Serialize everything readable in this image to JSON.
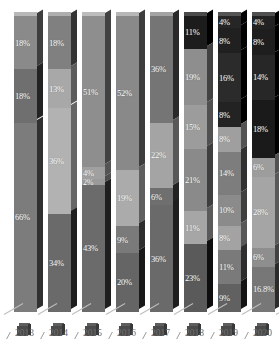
{
  "chart_data": {
    "type": "bar",
    "subtype": "stacked-percentage-3d",
    "title": "",
    "xlabel": "",
    "ylabel": "",
    "ylim": [
      0,
      100
    ],
    "grid": false,
    "legend": "none",
    "categories": [
      "2013",
      "2014",
      "2015",
      "2016",
      "2017",
      "2018",
      "2019",
      "2020"
    ],
    "label_suffix": "%",
    "bars": [
      {
        "category": "2013",
        "segments": [
          {
            "label": "18%",
            "value": 18,
            "color": "#8a8a8a"
          },
          {
            "label": "18%",
            "value": 18,
            "color": "#6f6f6f"
          },
          {
            "label": "66%",
            "value": 64,
            "color": "#7c7c7c"
          }
        ]
      },
      {
        "category": "2014",
        "segments": [
          {
            "label": "18%",
            "value": 18,
            "color": "#808080"
          },
          {
            "label": "13%",
            "value": 13,
            "color": "#a8a8a8"
          },
          {
            "label": "36%",
            "value": 36,
            "color": "#b2b2b2"
          },
          {
            "label": "34%",
            "value": 33,
            "color": "#6a6a6a"
          }
        ]
      },
      {
        "category": "2015",
        "segments": [
          {
            "label": "51%",
            "value": 51,
            "color": "#8e8e8e"
          },
          {
            "label": "4%",
            "value": 4,
            "color": "#a0a0a0"
          },
          {
            "label": "2%",
            "value": 2,
            "color": "#9a9a9a"
          },
          {
            "label": "43%",
            "value": 43,
            "color": "#6b6b6b"
          }
        ]
      },
      {
        "category": "2016",
        "segments": [
          {
            "label": "52%",
            "value": 52,
            "color": "#898989"
          },
          {
            "label": "19%",
            "value": 19,
            "color": "#ababab"
          },
          {
            "label": "9%",
            "value": 9,
            "color": "#7a7a7a"
          },
          {
            "label": "20%",
            "value": 20,
            "color": "#656565"
          }
        ]
      },
      {
        "category": "2017",
        "segments": [
          {
            "label": "36%",
            "value": 36,
            "color": "#757575"
          },
          {
            "label": "22%",
            "value": 22,
            "color": "#a4a4a4"
          },
          {
            "label": "6%",
            "value": 6,
            "color": "#6f6f6f"
          },
          {
            "label": "36%",
            "value": 36,
            "color": "#6a6a6a"
          }
        ]
      },
      {
        "category": "2018",
        "segments": [
          {
            "label": "11%",
            "value": 11,
            "color": "#1c1c1c"
          },
          {
            "label": "19%",
            "value": 19,
            "color": "#8e8e8e"
          },
          {
            "label": "15%",
            "value": 15,
            "color": "#9c9c9c"
          },
          {
            "label": "21%",
            "value": 21,
            "color": "#8a8a8a"
          },
          {
            "label": "11%",
            "value": 11,
            "color": "#a6a6a6"
          },
          {
            "label": "23%",
            "value": 23,
            "color": "#5a5a5a"
          }
        ]
      },
      {
        "category": "2019",
        "segments": [
          {
            "label": "4%",
            "value": 4,
            "color": "#262626"
          },
          {
            "label": "8%",
            "value": 8,
            "color": "#202020"
          },
          {
            "label": "16%",
            "value": 16,
            "color": "#2b2b2b"
          },
          {
            "label": "8%",
            "value": 8,
            "color": "#232323"
          },
          {
            "label": "8%",
            "value": 8,
            "color": "#9f9f9f"
          },
          {
            "label": "14%",
            "value": 14,
            "color": "#7d7d7d"
          },
          {
            "label": "10%",
            "value": 10,
            "color": "#8b8b8b"
          },
          {
            "label": "8%",
            "value": 8,
            "color": "#a3a3a3"
          },
          {
            "label": "11%",
            "value": 11,
            "color": "#7a7a7a"
          },
          {
            "label": "9%",
            "value": 9,
            "color": "#616161"
          }
        ]
      },
      {
        "category": "2020",
        "segments": [
          {
            "label": "4%",
            "value": 4,
            "color": "#222222"
          },
          {
            "label": "8%",
            "value": 8,
            "color": "#1e1e1e"
          },
          {
            "label": "14%",
            "value": 14,
            "color": "#272727"
          },
          {
            "label": "18%",
            "value": 18,
            "color": "#1a1a1a"
          },
          {
            "label": "6%",
            "value": 6,
            "color": "#9d9d9d"
          },
          {
            "label": "28%",
            "value": 22,
            "color": "#a5a5a5"
          },
          {
            "label": "6%",
            "value": 6,
            "color": "#8e8e8e"
          },
          {
            "label": "16.8%",
            "value": 14,
            "color": "#777777"
          }
        ]
      }
    ],
    "overlapping_labels": [
      {
        "category": "2020",
        "labels": [
          "6%",
          "28%"
        ],
        "note": "labels overlap near upper-middle of bar"
      },
      {
        "category": "2020",
        "labels": [
          "6%",
          "16.8%"
        ],
        "note": "labels overlap near lower portion of bar"
      },
      {
        "category": "2015",
        "labels": [
          "4%",
          "2%"
        ],
        "note": "thin adjacent segments with crowded labels"
      }
    ]
  },
  "axis": {
    "x_ticks": [
      "2013",
      "2014",
      "2015",
      "2016",
      "2017",
      "2018",
      "2019",
      "2020"
    ]
  }
}
